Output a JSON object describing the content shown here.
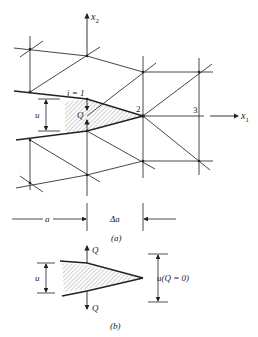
{
  "figure": {
    "part_a": {
      "caption": "(a)",
      "axis_x1": "x",
      "axis_x1_sub": "1",
      "axis_x2": "x",
      "axis_x2_sub": "2",
      "node_labels": {
        "n1": "i = 1",
        "n2": "2",
        "n3": "3"
      },
      "force_label": "Q",
      "opening_label": "u",
      "dim_a": "a",
      "dim_delta_a": "Δa"
    },
    "part_b": {
      "caption": "(b)",
      "force_top": "Q",
      "force_bottom": "Q",
      "opening_label": "u",
      "opening_zero_label": "u(Q = 0)"
    },
    "colors": {
      "line": "#333333",
      "background": "#ffffff"
    }
  }
}
